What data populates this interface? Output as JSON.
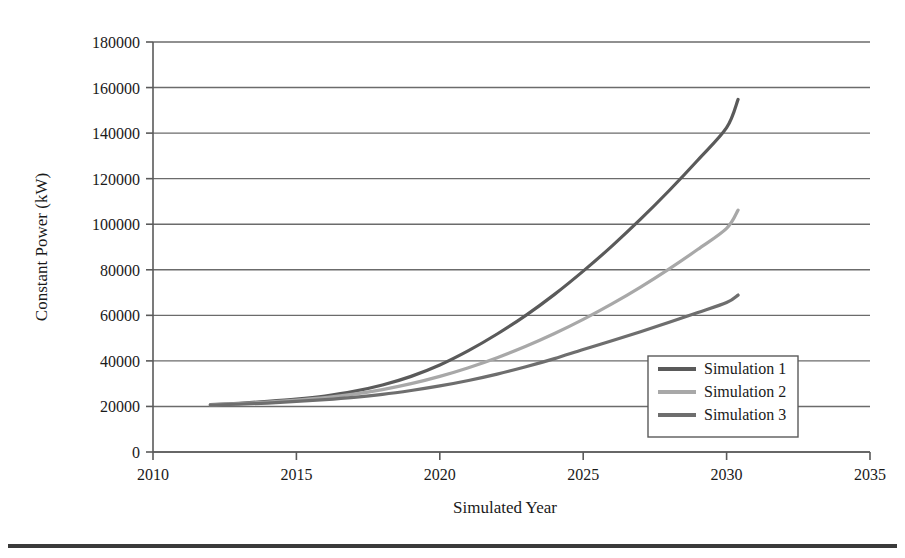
{
  "chart_data": {
    "type": "line",
    "title": "",
    "subtitle": "",
    "xlabel": "Simulated Year",
    "ylabel": "Constant Power (kW)",
    "xlim": [
      2010,
      2035
    ],
    "ylim": [
      0,
      180000
    ],
    "xticks": [
      2010,
      2015,
      2020,
      2025,
      2030,
      2035
    ],
    "xtick_labels": [
      "2010",
      "2015",
      "2020",
      "2025",
      "2030",
      "2035"
    ],
    "yticks": [
      0,
      20000,
      40000,
      60000,
      80000,
      100000,
      120000,
      140000,
      160000,
      180000
    ],
    "ytick_labels": [
      "0",
      "20000",
      "40000",
      "60000",
      "80000",
      "100000",
      "120000",
      "140000",
      "160000",
      "180000"
    ],
    "grid": "horizontal",
    "legend_position": "inside-lower-right",
    "x": [
      2012,
      2013,
      2014,
      2015,
      2016,
      2017,
      2018,
      2019,
      2020,
      2021,
      2022,
      2023,
      2024,
      2025,
      2026,
      2027,
      2028,
      2029,
      2030,
      2030.4
    ],
    "series": [
      {
        "name": "Simulation 1",
        "color": "#5a5a5a",
        "values": [
          20800,
          21400,
          22200,
          23200,
          24600,
          26600,
          29400,
          33200,
          38200,
          44500,
          51800,
          60000,
          69200,
          79400,
          90400,
          102200,
          114800,
          128200,
          142400,
          154800
        ]
      },
      {
        "name": "Simulation 2",
        "color": "#a8a8a8",
        "values": [
          20700,
          21200,
          21900,
          22800,
          23900,
          25400,
          27400,
          30000,
          33200,
          37000,
          41400,
          46400,
          52000,
          58200,
          65000,
          72400,
          80400,
          89000,
          98200,
          106200
        ]
      },
      {
        "name": "Simulation 3",
        "color": "#6e6e6e",
        "values": [
          20600,
          21000,
          21500,
          22200,
          23000,
          24000,
          25300,
          27000,
          29000,
          31400,
          34200,
          37400,
          41000,
          45000,
          48800,
          52800,
          57000,
          61200,
          65600,
          68900
        ]
      }
    ]
  },
  "legend": {
    "entries": [
      {
        "label": "Simulation 1"
      },
      {
        "label": "Simulation 2"
      },
      {
        "label": "Simulation 3"
      }
    ]
  },
  "style": {
    "grid_color": "#6b6b6b",
    "axis_color": "#5a5a5a",
    "text_color": "#1a1a1a",
    "background": "#ffffff",
    "rule_color": "#3a3a3a"
  }
}
